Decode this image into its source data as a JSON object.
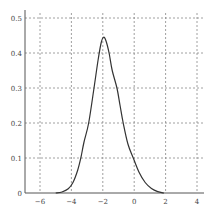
{
  "chart_data": {
    "type": "line",
    "title": "",
    "xlabel": "",
    "ylabel": "",
    "xlim": [
      -7,
      4.5
    ],
    "ylim": [
      0,
      0.52
    ],
    "grid": true,
    "legend": "none",
    "x_ticks": [
      -6,
      -4,
      -2,
      0,
      2,
      4
    ],
    "x_tick_labels": [
      "-6",
      "-4",
      "-2",
      "0",
      "2",
      "4"
    ],
    "y_ticks": [
      0,
      0.1,
      0.2,
      0.3,
      0.4,
      0.5
    ],
    "y_tick_labels": [
      "0",
      "0.1",
      "0.2",
      "0.3",
      "0.4",
      "0.5"
    ],
    "series": [
      {
        "name": "density",
        "color": "#333333",
        "x": [
          -5.0,
          -4.6,
          -4.2,
          -3.9,
          -3.6,
          -3.4,
          -3.2,
          -2.9,
          -2.56,
          -2.3,
          -2.1,
          -1.95,
          -1.8,
          -1.6,
          -1.4,
          -1.1,
          -0.9,
          -0.7,
          -0.4,
          -0.06,
          0.3,
          0.7,
          1.1,
          1.5,
          1.9
        ],
        "y": [
          0.0,
          0.003,
          0.012,
          0.03,
          0.065,
          0.1,
          0.145,
          0.2,
          0.3,
          0.38,
          0.43,
          0.445,
          0.435,
          0.4,
          0.35,
          0.3,
          0.25,
          0.2,
          0.14,
          0.1,
          0.06,
          0.03,
          0.013,
          0.004,
          0.0
        ]
      }
    ]
  }
}
